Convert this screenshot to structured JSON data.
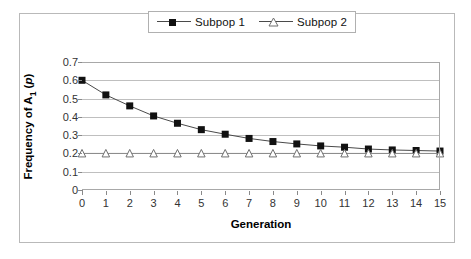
{
  "chart_data": {
    "type": "line",
    "title": "",
    "xlabel": "Generation",
    "ylabel": "Frequency of A1 (p)",
    "ylabel_parts": {
      "prefix": "Frequency of A",
      "sub": "1",
      "mid": " (",
      "italic": "p",
      "suffix": ")"
    },
    "x": [
      0,
      1,
      2,
      3,
      4,
      5,
      6,
      7,
      8,
      9,
      10,
      11,
      12,
      13,
      14,
      15
    ],
    "xticklabels": [
      "0",
      "1",
      "2",
      "3",
      "4",
      "5",
      "6",
      "7",
      "8",
      "9",
      "10",
      "11",
      "12",
      "13",
      "14",
      "15"
    ],
    "yticklabels": [
      "0.7",
      "0.6",
      "0.5",
      "0.4",
      "0.3",
      "0.2",
      "0.1",
      "0"
    ],
    "yticks": [
      0.7,
      0.6,
      0.5,
      0.4,
      0.3,
      0.2,
      0.1,
      0
    ],
    "ylim": [
      0,
      0.7
    ],
    "xlim": [
      0,
      15
    ],
    "grid": "horizontal",
    "legend_position": "top-center",
    "series": [
      {
        "name": "Subpop 1",
        "marker": "filled-square",
        "color": "#111111",
        "values": [
          0.6,
          0.52,
          0.46,
          0.405,
          0.365,
          0.33,
          0.305,
          0.282,
          0.265,
          0.252,
          0.241,
          0.234,
          0.224,
          0.219,
          0.216,
          0.213
        ]
      },
      {
        "name": "Subpop 2",
        "marker": "open-triangle",
        "color": "#8a8a8a",
        "values": [
          0.2,
          0.2,
          0.2,
          0.2,
          0.2,
          0.2,
          0.2,
          0.2,
          0.2,
          0.2,
          0.2,
          0.2,
          0.2,
          0.2,
          0.2,
          0.2
        ]
      }
    ]
  },
  "legend": {
    "entries": [
      {
        "label": "Subpop 1"
      },
      {
        "label": "Subpop 2"
      }
    ]
  }
}
